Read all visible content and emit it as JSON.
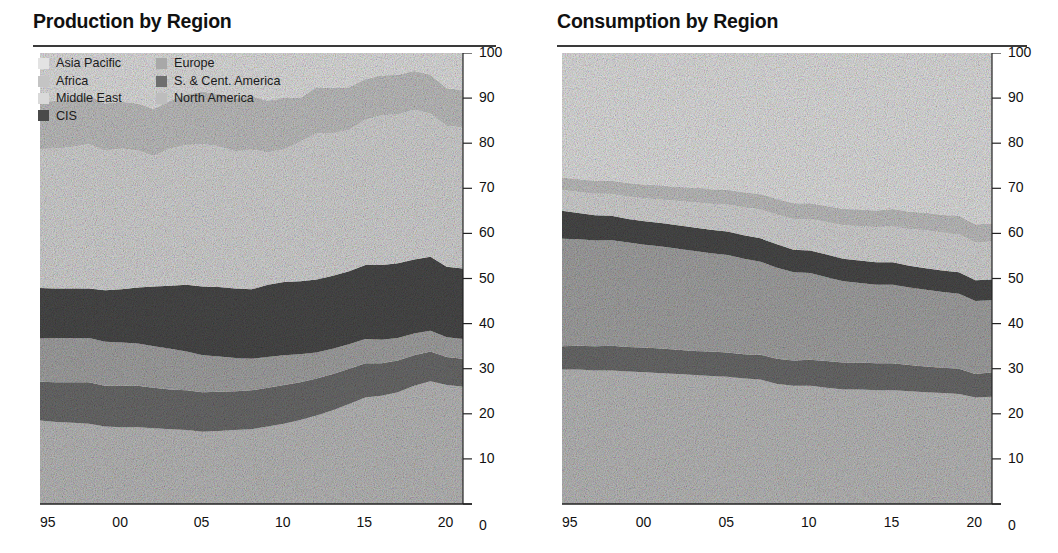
{
  "charts": [
    {
      "id": "production",
      "title": "Production by Region",
      "has_legend": true
    },
    {
      "id": "consumption",
      "title": "Consumption by Region",
      "has_legend": false
    }
  ],
  "legend": {
    "column1": [
      {
        "label": "Asia Pacific",
        "color": "#e3e3e3",
        "key": "asia_pacific"
      },
      {
        "label": "Africa",
        "color": "#c4c4c4",
        "key": "africa"
      },
      {
        "label": "Middle East",
        "color": "#d9d9d9",
        "key": "middle_east"
      },
      {
        "label": "CIS",
        "color": "#4a4a4a",
        "key": "cis"
      }
    ],
    "column2": [
      {
        "label": "Europe",
        "color": "#a8a8a8",
        "key": "europe"
      },
      {
        "label": "S. & Cent. America",
        "color": "#6e6e6e",
        "key": "s_cent_america"
      },
      {
        "label": "North America",
        "color": "#bdbdbd",
        "key": "north_america"
      }
    ]
  },
  "axis": {
    "y_ticks": [
      "100",
      "90",
      "80",
      "70",
      "60",
      "50",
      "40",
      "30",
      "20",
      "10",
      "0"
    ],
    "y_min": 0,
    "y_max": 100,
    "x_ticks": [
      "95",
      "00",
      "05",
      "10",
      "15",
      "20"
    ],
    "x_tick_years": [
      1995,
      2000,
      2005,
      2010,
      2015,
      2020
    ],
    "x_min": 1995,
    "x_max": 2021
  },
  "palette": {
    "asia_pacific": "#e2e2e2",
    "africa": "#c2c2c2",
    "middle_east": "#d6d6d6",
    "cis": "#4b4b4b",
    "europe": "#a5a5a5",
    "s_cent_america": "#6d6d6d",
    "north_america": "#bcbcbc",
    "axis": "#222222",
    "gridline": "#8d8d8d",
    "rule": "#3a3a3a"
  },
  "chart_data": [
    {
      "type": "area",
      "stacked": true,
      "normalized_percent": true,
      "title": "Production by Region",
      "xlabel": "",
      "ylabel": "",
      "ylim": [
        0,
        100
      ],
      "xlim": [
        1995,
        2021
      ],
      "grid": true,
      "legend_position": "top-left",
      "x": [
        1995,
        1996,
        1997,
        1998,
        1999,
        2000,
        2001,
        2002,
        2003,
        2004,
        2005,
        2006,
        2007,
        2008,
        2009,
        2010,
        2011,
        2012,
        2013,
        2014,
        2015,
        2016,
        2017,
        2018,
        2019,
        2020,
        2021
      ],
      "stack_order_bottom_to_top": [
        "north_america",
        "s_cent_america",
        "europe",
        "cis",
        "middle_east",
        "africa",
        "asia_pacific"
      ],
      "series": [
        {
          "name": "North America",
          "key": "north_america",
          "values": [
            18.5,
            18.2,
            18.0,
            17.8,
            17.2,
            17.0,
            17.0,
            16.8,
            16.6,
            16.4,
            16.0,
            16.2,
            16.4,
            16.6,
            17.2,
            17.8,
            18.6,
            19.6,
            20.8,
            22.2,
            23.6,
            24.0,
            24.8,
            26.2,
            27.2,
            26.4,
            26.0
          ]
        },
        {
          "name": "S. & Cent. America",
          "key": "s_cent_america",
          "values": [
            8.6,
            8.8,
            9.0,
            9.2,
            9.0,
            9.2,
            9.2,
            9.0,
            8.8,
            8.8,
            8.8,
            8.7,
            8.6,
            8.6,
            8.6,
            8.6,
            8.4,
            8.2,
            8.0,
            7.8,
            7.6,
            7.2,
            7.0,
            6.8,
            6.6,
            6.2,
            6.2
          ]
        },
        {
          "name": "Europe",
          "key": "europe",
          "values": [
            9.6,
            9.8,
            9.8,
            9.8,
            9.8,
            9.6,
            9.4,
            9.2,
            9.0,
            8.6,
            8.2,
            7.8,
            7.4,
            7.0,
            6.8,
            6.6,
            6.2,
            5.8,
            5.6,
            5.4,
            5.4,
            5.2,
            5.0,
            4.8,
            4.6,
            4.4,
            4.4
          ]
        },
        {
          "name": "CIS",
          "key": "cis",
          "values": [
            11.2,
            11.0,
            11.0,
            11.0,
            11.4,
            11.8,
            12.4,
            13.2,
            14.0,
            14.8,
            15.2,
            15.4,
            15.4,
            15.4,
            16.0,
            16.2,
            16.2,
            16.2,
            16.2,
            16.2,
            16.4,
            16.6,
            16.6,
            16.4,
            16.4,
            15.6,
            15.6
          ]
        },
        {
          "name": "Middle East",
          "key": "middle_east",
          "values": [
            30.8,
            31.0,
            31.4,
            32.0,
            31.0,
            31.2,
            30.4,
            29.0,
            30.4,
            31.0,
            31.6,
            31.2,
            30.4,
            31.0,
            29.4,
            29.4,
            31.0,
            32.4,
            31.6,
            31.4,
            32.2,
            33.2,
            33.0,
            33.2,
            31.8,
            31.2,
            31.4
          ]
        },
        {
          "name": "Africa",
          "key": "africa",
          "values": [
            10.4,
            10.6,
            10.6,
            10.6,
            10.4,
            10.4,
            10.4,
            10.4,
            10.6,
            11.2,
            11.6,
            11.6,
            11.6,
            11.8,
            11.4,
            11.4,
            9.6,
            10.2,
            10.0,
            9.4,
            9.0,
            8.8,
            8.8,
            8.6,
            8.6,
            8.4,
            8.2
          ]
        },
        {
          "name": "Asia Pacific",
          "key": "asia_pacific",
          "values": [
            10.9,
            10.6,
            10.2,
            9.6,
            11.2,
            10.8,
            11.2,
            12.4,
            10.6,
            9.2,
            8.6,
            9.1,
            10.2,
            9.6,
            10.6,
            10.0,
            10.0,
            7.6,
            7.8,
            7.6,
            5.8,
            5.0,
            4.8,
            4.0,
            4.8,
            7.8,
            8.2
          ]
        }
      ]
    },
    {
      "type": "area",
      "stacked": true,
      "normalized_percent": true,
      "title": "Consumption by Region",
      "xlabel": "",
      "ylabel": "",
      "ylim": [
        0,
        100
      ],
      "xlim": [
        1995,
        2021
      ],
      "grid": true,
      "legend_position": "none",
      "x": [
        1995,
        1996,
        1997,
        1998,
        1999,
        2000,
        2001,
        2002,
        2003,
        2004,
        2005,
        2006,
        2007,
        2008,
        2009,
        2010,
        2011,
        2012,
        2013,
        2014,
        2015,
        2016,
        2017,
        2018,
        2019,
        2020,
        2021
      ],
      "stack_order_bottom_to_top": [
        "north_america",
        "s_cent_america",
        "europe",
        "cis",
        "middle_east",
        "africa",
        "asia_pacific"
      ],
      "series": [
        {
          "name": "North America",
          "key": "north_america",
          "values": [
            29.8,
            29.8,
            29.6,
            29.6,
            29.4,
            29.2,
            29.0,
            28.8,
            28.6,
            28.4,
            28.2,
            27.8,
            27.6,
            26.6,
            26.2,
            26.2,
            25.8,
            25.4,
            25.4,
            25.2,
            25.2,
            25.0,
            24.8,
            24.6,
            24.4,
            23.6,
            23.8
          ]
        },
        {
          "name": "S. & Cent. America",
          "key": "s_cent_america",
          "values": [
            5.2,
            5.3,
            5.4,
            5.5,
            5.4,
            5.5,
            5.5,
            5.4,
            5.3,
            5.4,
            5.4,
            5.4,
            5.5,
            5.6,
            5.6,
            5.8,
            5.9,
            6.0,
            6.0,
            6.0,
            6.0,
            5.8,
            5.7,
            5.6,
            5.6,
            5.2,
            5.4
          ]
        },
        {
          "name": "Europe",
          "key": "europe",
          "values": [
            23.8,
            23.6,
            23.4,
            23.4,
            23.2,
            22.8,
            22.6,
            22.4,
            22.2,
            21.8,
            21.6,
            21.2,
            20.6,
            20.2,
            19.6,
            19.2,
            18.6,
            18.0,
            17.6,
            17.4,
            17.4,
            17.2,
            17.0,
            16.8,
            16.6,
            16.2,
            16.0
          ]
        },
        {
          "name": "CIS",
          "key": "cis",
          "values": [
            6.2,
            5.8,
            5.6,
            5.4,
            5.2,
            5.2,
            5.2,
            5.2,
            5.2,
            5.2,
            5.2,
            5.2,
            5.2,
            5.2,
            5.0,
            5.0,
            5.0,
            5.0,
            5.0,
            5.0,
            5.0,
            4.8,
            4.8,
            4.8,
            4.8,
            4.6,
            4.6
          ]
        },
        {
          "name": "Middle East",
          "key": "middle_east",
          "values": [
            4.6,
            4.7,
            4.8,
            4.9,
            5.0,
            5.1,
            5.2,
            5.4,
            5.6,
            5.8,
            6.0,
            6.2,
            6.4,
            6.6,
            6.8,
            7.0,
            7.2,
            7.4,
            7.6,
            7.8,
            8.0,
            8.2,
            8.4,
            8.4,
            8.5,
            8.4,
            8.4
          ]
        },
        {
          "name": "Africa",
          "key": "africa",
          "values": [
            2.8,
            2.8,
            2.9,
            2.9,
            3.0,
            3.0,
            3.1,
            3.1,
            3.2,
            3.2,
            3.3,
            3.3,
            3.4,
            3.4,
            3.5,
            3.5,
            3.6,
            3.6,
            3.7,
            3.7,
            3.8,
            3.8,
            3.9,
            3.9,
            4.0,
            4.0,
            4.0
          ]
        },
        {
          "name": "Asia Pacific",
          "key": "asia_pacific",
          "values": [
            27.6,
            28.0,
            28.3,
            28.3,
            28.8,
            29.2,
            29.4,
            29.7,
            29.9,
            30.2,
            30.3,
            30.9,
            31.3,
            32.4,
            33.3,
            33.3,
            33.9,
            34.6,
            34.7,
            34.9,
            34.6,
            35.2,
            35.4,
            35.9,
            36.1,
            38.0,
            37.8
          ]
        }
      ]
    }
  ]
}
